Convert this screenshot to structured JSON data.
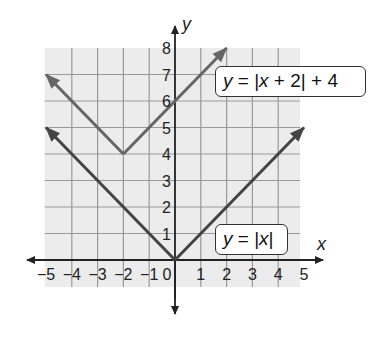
{
  "chart_data": {
    "type": "line",
    "title": "",
    "xlabel": "x",
    "ylabel": "y",
    "xlim": [
      -5,
      5
    ],
    "ylim": [
      -1,
      8
    ],
    "grid": true,
    "x_ticks": [
      -5,
      -4,
      -3,
      -2,
      -1,
      0,
      1,
      2,
      3,
      4,
      5
    ],
    "y_ticks": [
      1,
      2,
      3,
      4,
      5,
      6,
      7,
      8
    ],
    "series": [
      {
        "name": "y = |x|",
        "equation": "y = |x|",
        "points": [
          [
            -5,
            5
          ],
          [
            0,
            0
          ],
          [
            5,
            5
          ]
        ],
        "vertex": [
          0,
          0
        ],
        "color": "#444444"
      },
      {
        "name": "y = |x + 2| + 4",
        "equation": "y = |x + 2| + 4",
        "points": [
          [
            -5,
            7
          ],
          [
            -2,
            4
          ],
          [
            2,
            8
          ]
        ],
        "vertex": [
          -2,
          4
        ],
        "color": "#666666"
      }
    ],
    "annotations": [
      {
        "text": "y = |x + 2| + 4",
        "position": "upper-right"
      },
      {
        "text": "y = |x|",
        "position": "lower-right"
      }
    ]
  },
  "labels": {
    "x_axis": "x",
    "y_axis": "y",
    "zero": "0",
    "label1_y": "y",
    "label1_rest": " = |",
    "label1_x": "x",
    "label1_tail": " + 2| + 4",
    "label2_y": "y",
    "label2_rest": " = |",
    "label2_x": "x",
    "label2_tail": "|"
  },
  "colors": {
    "background": "#ececec",
    "grid": "#9a9a9a",
    "axis": "#222222"
  }
}
